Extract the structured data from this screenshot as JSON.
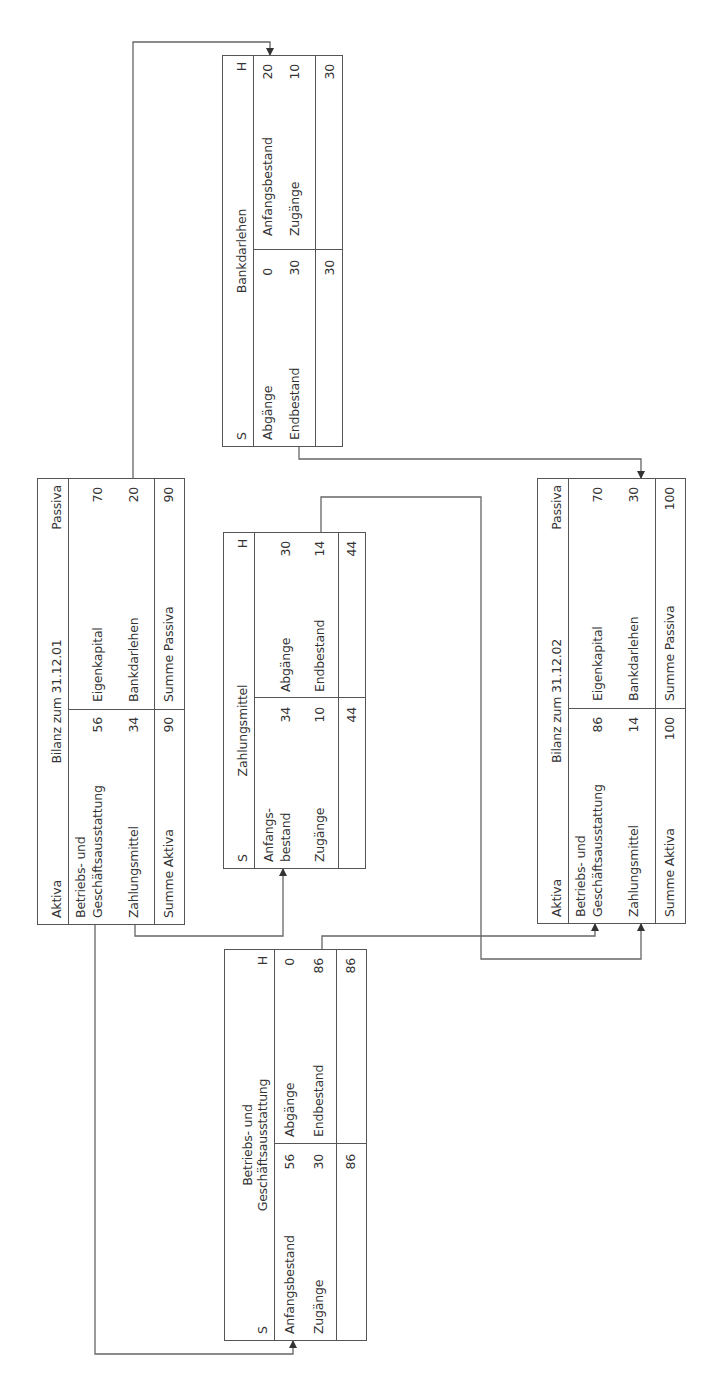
{
  "diagram": {
    "orientation": "rotated-90-counterclockwise",
    "bilanz_01": {
      "left_label": "Aktiva",
      "title": "Bilanz zum 31.12.01",
      "right_label": "Passiva",
      "aktiva": [
        {
          "label": "Betriebs- und Geschäftsausstattung",
          "label_line1": "Betriebs- und",
          "label_line2": "Geschäftsausstattung",
          "value": "56"
        },
        {
          "label": "Zahlungsmittel",
          "value": "34"
        }
      ],
      "passiva": [
        {
          "label": "Eigenkapital",
          "value": "70"
        },
        {
          "label": "Bankdarlehen",
          "value": "20"
        }
      ],
      "sum_aktiva_label": "Summe Aktiva",
      "sum_aktiva_value": "90",
      "sum_passiva_label": "Summe Passiva",
      "sum_passiva_value": "90"
    },
    "konto_bga": {
      "soll": "S",
      "title_line1": "Betriebs- und",
      "title_line2": "Geschäftsausstattung",
      "haben": "H",
      "soll_rows": [
        {
          "label": "Anfangsbestand",
          "value": "56"
        },
        {
          "label": "Zugänge",
          "value": "30"
        }
      ],
      "haben_rows": [
        {
          "label": "Abgänge",
          "value": "0"
        },
        {
          "label": "Endbestand",
          "value": "86"
        }
      ],
      "soll_total": "86",
      "haben_total": "86"
    },
    "konto_zahlungsmittel": {
      "soll": "S",
      "title": "Zahlungsmittel",
      "haben": "H",
      "soll_rows": [
        {
          "label_line1": "Anfangs-",
          "label_line2": "bestand",
          "value": "34"
        },
        {
          "label": "Zugänge",
          "value": "10"
        }
      ],
      "haben_rows": [
        {
          "label": "Abgänge",
          "value": "30"
        },
        {
          "label": "Endbestand",
          "value": "14"
        }
      ],
      "soll_total": "44",
      "haben_total": "44"
    },
    "konto_bankdarlehen": {
      "soll": "S",
      "title": "Bankdarlehen",
      "haben": "H",
      "soll_rows": [
        {
          "label": "Abgänge",
          "value": "0"
        },
        {
          "label": "Endbestand",
          "value": "30"
        }
      ],
      "haben_rows": [
        {
          "label": "Anfangsbestand",
          "value": "20"
        },
        {
          "label": "Zugänge",
          "value": "10"
        }
      ],
      "soll_total": "30",
      "haben_total": "30"
    },
    "bilanz_02": {
      "left_label": "Aktiva",
      "title": "Bilanz zum 31.12.02",
      "right_label": "Passiva",
      "aktiva": [
        {
          "label_line1": "Betriebs- und",
          "label_line2": "Geschäftsausstattung",
          "value": "86"
        },
        {
          "label": "Zahlungsmittel",
          "value": "14"
        }
      ],
      "passiva": [
        {
          "label": "Eigenkapital",
          "value": "70"
        },
        {
          "label": "Bankdarlehen",
          "value": "30"
        }
      ],
      "sum_aktiva_label": "Summe Aktiva",
      "sum_aktiva_value": "100",
      "sum_passiva_label": "Summe Passiva",
      "sum_passiva_value": "100"
    },
    "connections": [
      {
        "from": "Bilanz 31.12.01 / Betriebs- und Geschäftsausstattung",
        "to": "Konto BGA / Anfangsbestand"
      },
      {
        "from": "Bilanz 31.12.01 / Zahlungsmittel",
        "to": "Konto Zahlungsmittel / Anfangsbestand"
      },
      {
        "from": "Bilanz 31.12.01 / Bankdarlehen",
        "to": "Konto Bankdarlehen / Anfangsbestand"
      },
      {
        "from": "Konto BGA / Endbestand",
        "to": "Bilanz 31.12.02 / Betriebs- und Geschäftsausstattung"
      },
      {
        "from": "Konto Zahlungsmittel / Endbestand",
        "to": "Bilanz 31.12.02 / Zahlungsmittel"
      },
      {
        "from": "Konto Bankdarlehen / Endbestand",
        "to": "Bilanz 31.12.02 / Bankdarlehen"
      }
    ],
    "colors": {
      "line": "#555555",
      "text": "#333333",
      "background": "#ffffff"
    }
  }
}
